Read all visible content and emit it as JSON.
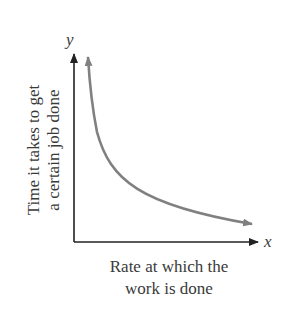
{
  "diagram": {
    "axis_x_var": "x",
    "axis_y_var": "y",
    "y_label": "Time it takes to get a certain job done",
    "y_label_lines": [
      "Time it takes to get",
      "a certain job done"
    ],
    "x_label_lines": [
      "Rate at which the",
      "work is done"
    ],
    "curve": "decreasing hyperbolic curve (inverse variation), arrows on both ends",
    "colors": {
      "axes": "#222222",
      "curve": "#808080",
      "text": "#3a3a3a"
    }
  }
}
